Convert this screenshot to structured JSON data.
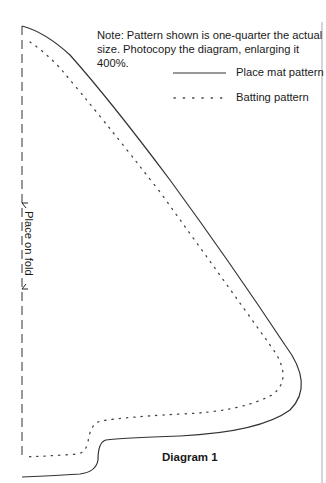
{
  "note": "Note: Pattern shown is one-quarter the actual size. Photocopy the diagram, enlarging it 400%.",
  "legend": [
    {
      "label": "Place mat pattern",
      "style": "solid"
    },
    {
      "label": "Batting pattern",
      "style": "dotted"
    }
  ],
  "fold_label": "Place on fold",
  "caption": "Diagram 1",
  "colors": {
    "line": "#333333",
    "dotted": "#444444",
    "background": "#ffffff"
  }
}
